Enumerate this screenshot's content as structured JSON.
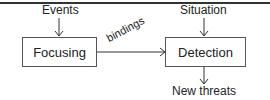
{
  "diagram": {
    "type": "flow",
    "nodes": [
      {
        "id": "focusing",
        "label": "Focusing"
      },
      {
        "id": "detection",
        "label": "Detection"
      }
    ],
    "inputs": {
      "events": "Events",
      "situation": "Situation"
    },
    "outputs": {
      "new_threats": "New threats"
    },
    "edges": [
      {
        "from": "events",
        "to": "focusing",
        "label": ""
      },
      {
        "from": "situation",
        "to": "detection",
        "label": ""
      },
      {
        "from": "focusing",
        "to": "detection",
        "label": "bindings"
      },
      {
        "from": "detection",
        "to": "new_threats",
        "label": ""
      }
    ],
    "edge_labels": {
      "bindings": "bindings"
    },
    "colors": {
      "line": "#333333",
      "box_border": "#555555",
      "text": "#222222"
    }
  }
}
